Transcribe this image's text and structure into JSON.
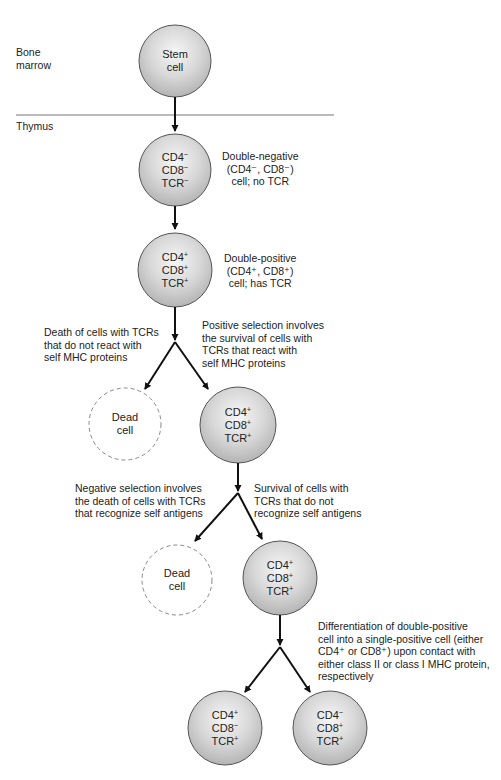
{
  "regions": {
    "bone_marrow": "Bone\nmarrow",
    "thymus": "Thymus"
  },
  "colors": {
    "cell_fill_light": "#f4f4f4",
    "cell_fill_dark": "#b8b8b8",
    "cell_stroke": "#555555",
    "dead_stroke": "#888888",
    "arrow": "#111111",
    "divider": "#777777"
  },
  "cells": {
    "stem": {
      "lines": [
        "Stem",
        "cell"
      ]
    },
    "double_negative": {
      "lines": [
        "CD4",
        "CD8",
        "TCR"
      ],
      "signs": [
        "−",
        "−",
        "−"
      ]
    },
    "double_positive": {
      "lines": [
        "CD4",
        "CD8",
        "TCR"
      ],
      "signs": [
        "+",
        "+",
        "+"
      ]
    },
    "positive_selected": {
      "lines": [
        "CD4",
        "CD8",
        "TCR"
      ],
      "signs": [
        "+",
        "+",
        "+"
      ]
    },
    "dead_1": {
      "lines": [
        "Dead",
        "cell"
      ]
    },
    "negative_selected": {
      "lines": [
        "CD4",
        "CD8",
        "TCR"
      ],
      "signs": [
        "+",
        "+",
        "+"
      ]
    },
    "dead_2": {
      "lines": [
        "Dead",
        "cell"
      ]
    },
    "cd4_single": {
      "lines": [
        "CD4",
        "CD8",
        "TCR"
      ],
      "signs": [
        "+",
        "−",
        "+"
      ]
    },
    "cd8_single": {
      "lines": [
        "CD4",
        "CD8",
        "TCR"
      ],
      "signs": [
        "−",
        "+",
        "+"
      ]
    }
  },
  "annotations": {
    "double_negative": [
      "Double-negative",
      "(CD4⁻, CD8⁻)",
      "cell; no TCR"
    ],
    "double_positive": [
      "Double-positive",
      "(CD4⁺, CD8⁺)",
      "cell; has TCR"
    ],
    "death_no_mhc": [
      "Death of cells with TCRs",
      "that do not react with",
      "self MHC proteins"
    ],
    "positive_selection": [
      "Positive selection involves",
      "the survival of cells with",
      "TCRs that react with",
      "self MHC proteins"
    ],
    "negative_selection": [
      "Negative selection involves",
      "the death of cells with TCRs",
      "that recognize self antigens"
    ],
    "survival_no_self": [
      "Survival of cells with",
      "TCRs that do not",
      "recognize self antigens"
    ],
    "differentiation": [
      "Differentiation of double-positive",
      "cell into a single-positive cell (either",
      "CD4⁺ or CD8⁺) upon contact with",
      "either class II or class I MHC protein,",
      "respectively"
    ]
  }
}
